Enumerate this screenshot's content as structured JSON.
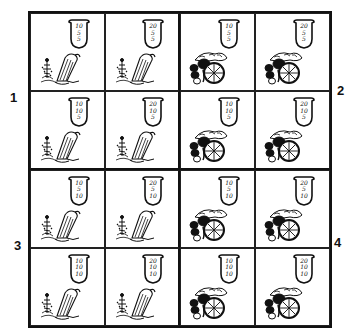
{
  "quadrant_labels": {
    "q1": "1",
    "q2": "2",
    "q3": "3",
    "q4": "4"
  },
  "colors": {
    "ink": "#111111",
    "background": "#ffffff"
  },
  "cells": [
    {
      "row": 0,
      "col": 0,
      "quadrant": 1,
      "image": "plant-figure-drawing",
      "label": {
        "top": "10",
        "middle": "5",
        "bottom": "5"
      }
    },
    {
      "row": 0,
      "col": 1,
      "quadrant": 1,
      "image": "plant-figure-drawing",
      "label": {
        "top": "20",
        "middle": "5",
        "bottom": "5"
      }
    },
    {
      "row": 0,
      "col": 2,
      "quadrant": 2,
      "image": "fruit-pile-drawing",
      "label": {
        "top": "10",
        "middle": "5",
        "bottom": "5"
      }
    },
    {
      "row": 0,
      "col": 3,
      "quadrant": 2,
      "image": "fruit-pile-drawing",
      "label": {
        "top": "20",
        "middle": "5",
        "bottom": "5"
      }
    },
    {
      "row": 1,
      "col": 0,
      "quadrant": 1,
      "image": "plant-figure-drawing",
      "label": {
        "top": "10",
        "middle": "10",
        "bottom": "5"
      }
    },
    {
      "row": 1,
      "col": 1,
      "quadrant": 1,
      "image": "plant-figure-drawing",
      "label": {
        "top": "20",
        "middle": "10",
        "bottom": "5"
      }
    },
    {
      "row": 1,
      "col": 2,
      "quadrant": 2,
      "image": "fruit-pile-drawing",
      "label": {
        "top": "10",
        "middle": "10",
        "bottom": "5"
      }
    },
    {
      "row": 1,
      "col": 3,
      "quadrant": 2,
      "image": "fruit-pile-drawing",
      "label": {
        "top": "20",
        "middle": "10",
        "bottom": "5"
      }
    },
    {
      "row": 2,
      "col": 0,
      "quadrant": 3,
      "image": "plant-figure-drawing",
      "label": {
        "top": "10",
        "middle": "5",
        "bottom": "10"
      }
    },
    {
      "row": 2,
      "col": 1,
      "quadrant": 3,
      "image": "plant-figure-drawing",
      "label": {
        "top": "20",
        "middle": "5",
        "bottom": "10"
      }
    },
    {
      "row": 2,
      "col": 2,
      "quadrant": 4,
      "image": "fruit-pile-drawing",
      "label": {
        "top": "10",
        "middle": "5",
        "bottom": "10"
      }
    },
    {
      "row": 2,
      "col": 3,
      "quadrant": 4,
      "image": "fruit-pile-drawing",
      "label": {
        "top": "20",
        "middle": "5",
        "bottom": "10"
      }
    },
    {
      "row": 3,
      "col": 0,
      "quadrant": 3,
      "image": "plant-figure-drawing",
      "label": {
        "top": "10",
        "middle": "10",
        "bottom": "10"
      }
    },
    {
      "row": 3,
      "col": 1,
      "quadrant": 3,
      "image": "plant-figure-drawing",
      "label": {
        "top": "20",
        "middle": "10",
        "bottom": "10"
      }
    },
    {
      "row": 3,
      "col": 2,
      "quadrant": 4,
      "image": "fruit-pile-drawing",
      "label": {
        "top": "10",
        "middle": "10",
        "bottom": "10"
      }
    },
    {
      "row": 3,
      "col": 3,
      "quadrant": 4,
      "image": "fruit-pile-drawing",
      "label": {
        "top": "20",
        "middle": "10",
        "bottom": "10"
      }
    }
  ]
}
